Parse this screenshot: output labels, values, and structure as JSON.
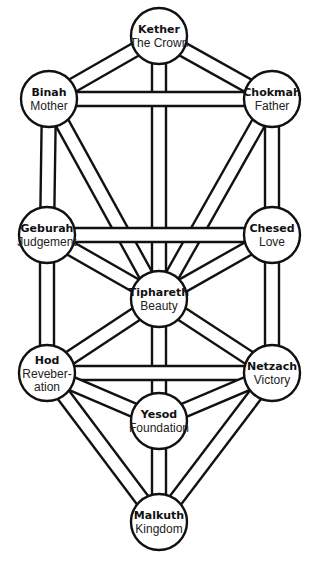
{
  "diagram": {
    "style": {
      "stroke": "#111111",
      "fill": "#ffffff",
      "node_radius": 28,
      "path_width": 14
    },
    "nodes": [
      {
        "id": "kether",
        "title": "Kether",
        "subtitle": [
          "The Crown"
        ],
        "x": 159,
        "y": 36
      },
      {
        "id": "binah",
        "title": "Binah",
        "subtitle": [
          "Mother"
        ],
        "x": 49,
        "y": 99
      },
      {
        "id": "chokmah",
        "title": "Chokmah",
        "subtitle": [
          "Father"
        ],
        "x": 272,
        "y": 99
      },
      {
        "id": "geburah",
        "title": "Geburah",
        "subtitle": [
          "Judgement"
        ],
        "x": 47,
        "y": 235
      },
      {
        "id": "chesed",
        "title": "Chesed",
        "subtitle": [
          "Love"
        ],
        "x": 272,
        "y": 235
      },
      {
        "id": "tiphareth",
        "title": "Tiphareth",
        "subtitle": [
          "Beauty"
        ],
        "x": 159,
        "y": 299
      },
      {
        "id": "hod",
        "title": "Hod",
        "subtitle": [
          "Reveber-",
          "ation"
        ],
        "x": 47,
        "y": 373
      },
      {
        "id": "netzach",
        "title": "Netzach",
        "subtitle": [
          "Victory"
        ],
        "x": 272,
        "y": 373
      },
      {
        "id": "yesod",
        "title": "Yesod",
        "subtitle": [
          "Foundation"
        ],
        "x": 159,
        "y": 421
      },
      {
        "id": "malkuth",
        "title": "Malkuth",
        "subtitle": [
          "Kingdom"
        ],
        "x": 159,
        "y": 522
      }
    ],
    "paths": [
      [
        "kether",
        "binah"
      ],
      [
        "kether",
        "chokmah"
      ],
      [
        "kether",
        "tiphareth"
      ],
      [
        "binah",
        "chokmah"
      ],
      [
        "binah",
        "geburah"
      ],
      [
        "binah",
        "tiphareth"
      ],
      [
        "chokmah",
        "chesed"
      ],
      [
        "chokmah",
        "tiphareth"
      ],
      [
        "geburah",
        "chesed"
      ],
      [
        "geburah",
        "tiphareth"
      ],
      [
        "geburah",
        "hod"
      ],
      [
        "chesed",
        "tiphareth"
      ],
      [
        "chesed",
        "netzach"
      ],
      [
        "tiphareth",
        "hod"
      ],
      [
        "tiphareth",
        "netzach"
      ],
      [
        "tiphareth",
        "yesod"
      ],
      [
        "hod",
        "netzach"
      ],
      [
        "hod",
        "yesod"
      ],
      [
        "hod",
        "malkuth"
      ],
      [
        "netzach",
        "yesod"
      ],
      [
        "netzach",
        "malkuth"
      ],
      [
        "yesod",
        "malkuth"
      ]
    ]
  }
}
